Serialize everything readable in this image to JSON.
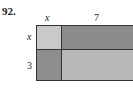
{
  "problem": {
    "number": "92."
  },
  "labels": {
    "top": [
      {
        "text": "x",
        "italic": true
      },
      {
        "text": "7",
        "italic": false
      }
    ],
    "left": [
      {
        "text": "x",
        "italic": true
      },
      {
        "text": "3",
        "italic": false
      }
    ]
  },
  "colors": {
    "top_left": "#c9c9c9",
    "top_right": "#8b8b8b",
    "bottom_left": "#8e8e8e",
    "bottom_right": "#b9b9b9",
    "border": "#333333"
  }
}
